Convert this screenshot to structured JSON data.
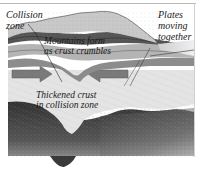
{
  "diagram": {
    "type": "geological cross-section",
    "labels": {
      "collision_zone": [
        "Collision",
        "zone"
      ],
      "plates_moving_together": [
        "Plates",
        "moving",
        "together"
      ],
      "mountains_form": [
        "Mountains form",
        "as crust crumbles"
      ],
      "thickened_crust": [
        "Thickened crust",
        "in collision zone"
      ]
    },
    "colors": {
      "background": "#ffffff",
      "surface_light": "#d9d9d9",
      "crust_band_dark": "#5a5a5a",
      "crust_band_mid": "#9a9a9a",
      "crust_light": "#e2e2e2",
      "arrow_gray": "#7a7a7a",
      "mantle_dark": "#3a3a3a",
      "mantle_light": "#bdbdbd",
      "text": "#1a1a1a"
    },
    "arrows": [
      {
        "direction": "right",
        "position": "left side of thickened crust"
      },
      {
        "direction": "left",
        "position": "right side of thickened crust"
      }
    ]
  }
}
